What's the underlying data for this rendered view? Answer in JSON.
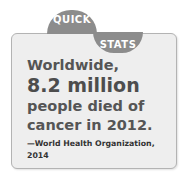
{
  "tabs": {
    "quick": "QUICK",
    "stats": "STATS"
  },
  "stat": {
    "line1": "Worldwide,",
    "highlight": "8.2 million",
    "line3": "people died of",
    "line4": "cancer in 2012.",
    "source": "—World Health Organization, 2014"
  },
  "colors": {
    "tab": "#8c8c8c",
    "box_fill": "#eeeeee",
    "box_border": "#b3b3b3",
    "text": "#555555"
  }
}
